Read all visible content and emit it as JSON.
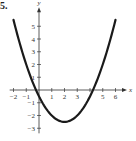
{
  "problem_number": "5.",
  "chart_data": {
    "type": "line",
    "title": "",
    "xlabel": "x",
    "ylabel": "y",
    "function": "y = 0.5x^2 - 2x - 0.5",
    "xlim": [
      -2.3,
      6.9
    ],
    "ylim": [
      -3.4,
      6.5
    ],
    "xticks": [
      -2,
      -1,
      1,
      2,
      3,
      5,
      6
    ],
    "xtick_labels": [
      "−2",
      "−1",
      "1",
      "2",
      "3",
      "5",
      "6"
    ],
    "yticks": [
      5,
      4,
      3,
      2,
      1,
      -1,
      -2,
      -3
    ],
    "ytick_labels": [
      "5",
      "4",
      "3",
      "2",
      "1",
      "−1",
      "−2",
      "−3"
    ],
    "grid": false,
    "vertex": [
      2,
      -2.5
    ],
    "roots": [
      -0.24,
      4.24
    ],
    "x": [
      -2,
      -1.5,
      -1,
      -0.5,
      0,
      0.5,
      1,
      1.5,
      2,
      2.5,
      3,
      3.5,
      4,
      4.5,
      5,
      5.5,
      6
    ],
    "y": [
      5.5,
      3.625,
      2,
      0.625,
      -0.5,
      -1.375,
      -2,
      -2.375,
      -2.5,
      -2.375,
      -2,
      -1.375,
      -0.5,
      0.625,
      2,
      3.625,
      5.5
    ],
    "colors": {
      "curve": "#1a1a1a",
      "axes": "#333333"
    }
  }
}
